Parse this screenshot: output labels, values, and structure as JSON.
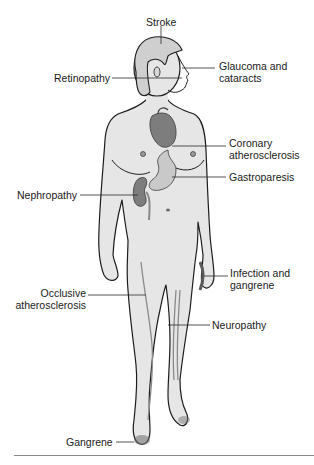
{
  "diagram": {
    "colors": {
      "skin": "#e6e6e6",
      "outline": "#1c1c1c",
      "organ_dark": "#7d7d7d",
      "organ_light": "#c9c9c9",
      "leader_line": "#2a2a2a",
      "divider": "#8a8a8a"
    },
    "labels": {
      "stroke": "Stroke",
      "retinopathy": "Retinopathy",
      "glaucoma_line1": "Glaucoma and",
      "glaucoma_line2": "cataracts",
      "coronary_line1": "Coronary",
      "coronary_line2": "atherosclerosis",
      "gastroparesis": "Gastroparesis",
      "nephropathy": "Nephropathy",
      "infection_line1": "Infection and",
      "infection_line2": "gangrene",
      "occlusive_line1": "Occlusive",
      "occlusive_line2": "atherosclerosis",
      "neuropathy": "Neuropathy",
      "gangrene": "Gangrene"
    }
  }
}
